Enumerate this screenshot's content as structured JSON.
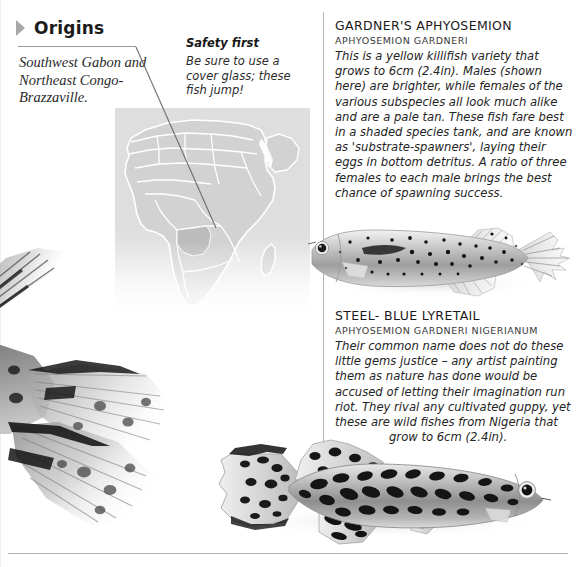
{
  "origins": {
    "heading": "Origins",
    "bullet_icon": "triangle-right-icon",
    "caption": "Southwest Gabon and Northeast Congo-Brazzaville."
  },
  "safety": {
    "title": "Safety first",
    "body": "Be sure to use a cover glass; these fish jump!"
  },
  "map": {
    "name": "africa-map",
    "highlight_region": "Gabon / Congo-Brazzaville",
    "land_color": "#d2d2d2",
    "border_color": "#ffffff",
    "highlight_color": "#bcbcbc",
    "background_color": "#dedede"
  },
  "entries": [
    {
      "common_name": "GARDNER'S APHYOSEMION",
      "latin_name": "APHYOSEMION GARDNERI",
      "body": "This is a yellow killifish variety that grows to 6cm (2.4in). Males (shown here) are brighter, while females of the various subspecies all look much alike and are a pale tan. These fish fare best in a shaded species tank, and are known as 'substrate-spawners', laying their eggs in bottom detritus. A ratio of three females to each male brings the best chance of spawning success.",
      "photo_name": "gardners-aphyosemion-photo"
    },
    {
      "common_name": "STEEL- BLUE LYRETAIL",
      "latin_name": "APHYOSEMION GARDNERI NIGERIANUM",
      "body": "Their common name does not do these little gems justice – any artist painting them as nature has done would be accused of letting their imagination run riot. They rival any cultivated guppy, yet these are wild fishes from Nigeria that",
      "body_tail": "grow to 6cm (2.4in).",
      "photo_name": "steel-blue-lyretail-photo"
    }
  ],
  "decorative_photos": [
    {
      "name": "guppy-tail-top-left-photo"
    },
    {
      "name": "guppy-body-left-photo"
    }
  ]
}
